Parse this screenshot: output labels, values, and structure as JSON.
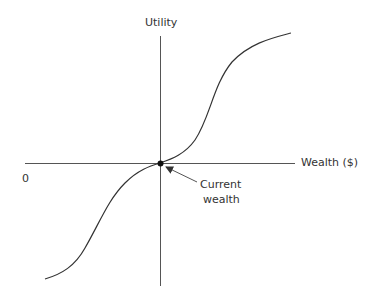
{
  "diagram": {
    "y_axis_label": "Utility",
    "x_axis_label": "Wealth ($)",
    "origin_label": "0",
    "annotation_line1": "Current",
    "annotation_line2": "wealth",
    "colors": {
      "line": "#333333",
      "axis": "#555555"
    }
  }
}
